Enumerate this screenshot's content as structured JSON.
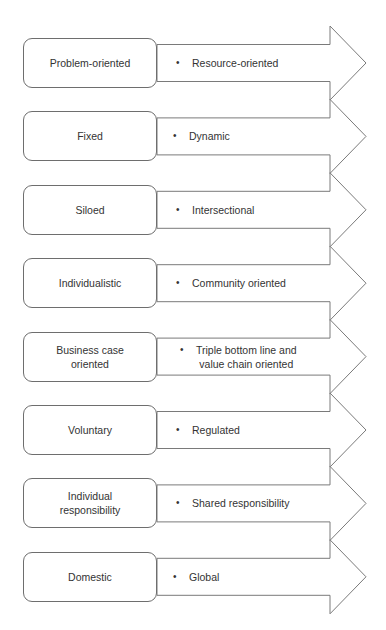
{
  "diagram": {
    "type": "paired-transition-arrows",
    "stroke_color": "#7a7a7a",
    "text_color": "#333333",
    "bullet_glyph": "•",
    "rows": [
      {
        "from": "Problem-oriented",
        "to": "Resource-oriented"
      },
      {
        "from": "Fixed",
        "to": "Dynamic"
      },
      {
        "from": "Siloed",
        "to": "Intersectional"
      },
      {
        "from": "Individualistic",
        "to": "Community oriented"
      },
      {
        "from": "Business case\noriented",
        "to": "Triple bottom line and\nvalue chain oriented"
      },
      {
        "from": "Voluntary",
        "to": "Regulated"
      },
      {
        "from": "Individual\nresponsibility",
        "to": "Shared responsibility"
      },
      {
        "from": "Domestic",
        "to": "Global"
      }
    ]
  },
  "caption": {
    "text": "",
    "note": "cropped at bottom edge, illegible"
  }
}
